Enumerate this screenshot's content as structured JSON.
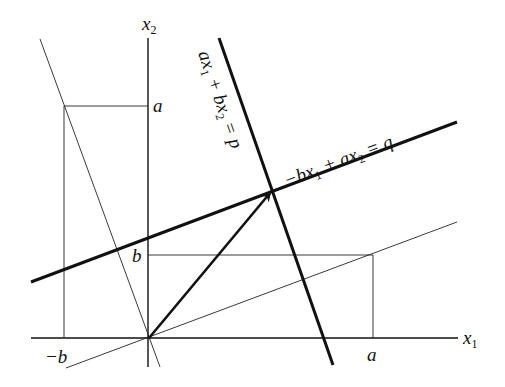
{
  "diagram": {
    "axes": {
      "x1_label": "x",
      "x1_sub": "1",
      "x2_label": "x",
      "x2_sub": "2"
    },
    "ticks": {
      "x2_a": "a",
      "x2_b": "b",
      "x1_a": "a",
      "x1_neg_b": "−b"
    },
    "lines": {
      "line_p": {
        "equation_part1": "ax",
        "sub1": "1",
        "equation_part2": " + bx",
        "sub2": "2",
        "equation_part3": " = p"
      },
      "line_q": {
        "equation_part1": "−bx",
        "sub1": "1",
        "equation_part2": " + ax",
        "sub2": "2",
        "equation_part3": " = q"
      }
    },
    "colors": {
      "ink": "#111111",
      "background": "#ffffff"
    }
  }
}
